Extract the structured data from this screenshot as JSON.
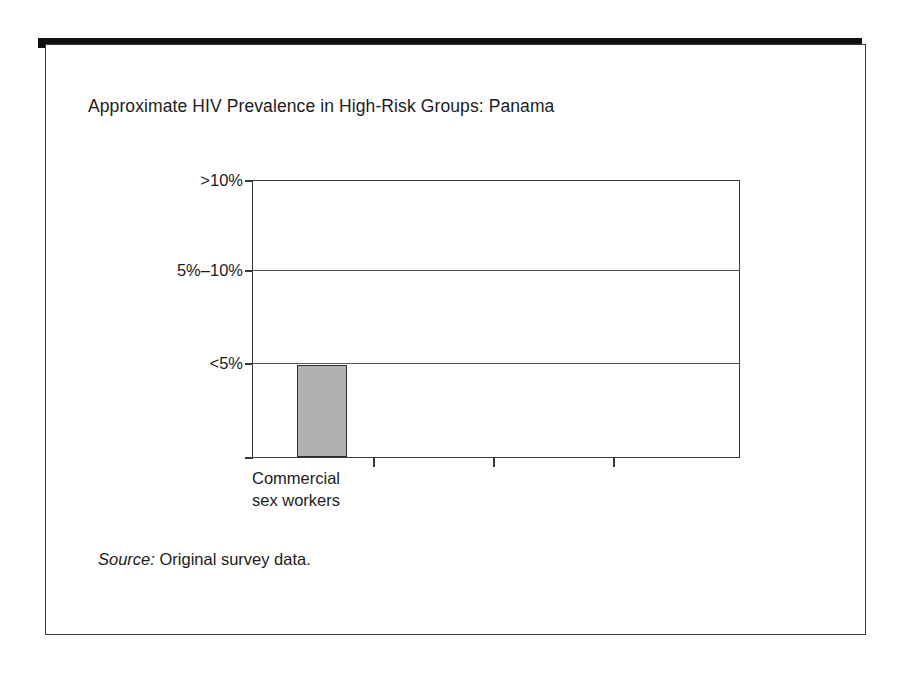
{
  "slide": {
    "title": "Approximate HIV Prevalence in High-Risk Groups: Panama",
    "source_label": "Source:",
    "source_text": "Original survey data.",
    "frame_color": "#3c3c3c",
    "top_bar_color": "#111111",
    "background_color": "#ffffff"
  },
  "chart_data": {
    "type": "bar",
    "title": "Approximate HIV Prevalence in High-Risk Groups: Panama",
    "xlabel": "",
    "ylabel": "",
    "categories": [
      "Commercial sex workers"
    ],
    "category_lines": [
      [
        "Commercial",
        "sex workers"
      ]
    ],
    "values": [
      1
    ],
    "value_labels": [
      "<5%"
    ],
    "ytick_labels": [
      "<5%",
      "5%–10%",
      ">10%"
    ],
    "ytick_values": [
      1,
      2,
      3
    ],
    "ylim": [
      0,
      3
    ],
    "grid": true,
    "legend": false,
    "bar_fill_color": "#b0b0b0",
    "bar_edge_color": "#2c2c2c",
    "gridline_color": "#555555",
    "axis_color": "#3a3a3a",
    "n_category_slots": 4,
    "note": "Single bar reaching the <5% level; remaining three category slots on the x-axis are empty."
  }
}
